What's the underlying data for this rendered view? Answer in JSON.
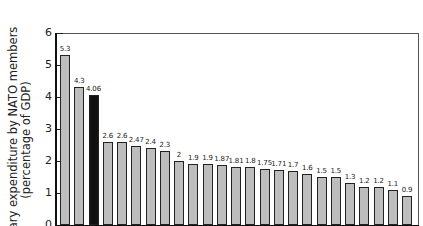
{
  "chart_data": {
    "type": "bar",
    "title": "",
    "xlabel": "",
    "ylabel": "Military expenditure by NATO members (percentage of GDP)",
    "ylabel_lines": [
      "Military expenditure by NATO members",
      "(percentage of GDP)"
    ],
    "ylim": [
      0,
      6
    ],
    "yticks": [
      0,
      1,
      2,
      3,
      4,
      5,
      6
    ],
    "grid": false,
    "legend": null,
    "categories": [
      "1",
      "2",
      "3",
      "4",
      "5",
      "6",
      "7",
      "8",
      "9",
      "10",
      "11",
      "12",
      "13",
      "14",
      "15",
      "16",
      "17",
      "18",
      "19",
      "20",
      "21",
      "22",
      "23",
      "24",
      "25"
    ],
    "values": [
      5.3,
      4.3,
      4.06,
      2.6,
      2.6,
      2.47,
      2.4,
      2.3,
      2,
      1.9,
      1.9,
      1.87,
      1.81,
      1.8,
      1.75,
      1.71,
      1.7,
      1.6,
      1.5,
      1.5,
      1.3,
      1.2,
      1.2,
      1.1,
      0.9
    ],
    "value_labels": [
      "5.3",
      "4.3",
      "4.06",
      "2.6",
      "2.6",
      "2.47",
      "2.4",
      "2.3",
      "2",
      "1.9",
      "1.9",
      "1.87",
      "1.81",
      "1.8",
      "1.75",
      "1.71",
      "1.7",
      "1.6",
      "1.5",
      "1.5",
      "1.3",
      "1.2",
      "1.2",
      "1.1",
      "0.9"
    ],
    "highlighted_index": 2,
    "colors": {
      "bar": "#bdbdbd",
      "highlight": "#111111",
      "outline": "#222222"
    }
  }
}
